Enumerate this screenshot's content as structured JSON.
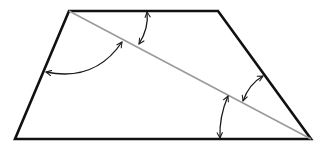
{
  "diagram": {
    "type": "geometry",
    "shape": "trapezoid",
    "colors": {
      "edge": "#111111",
      "diagonal": "#9a9a9a",
      "arrow": "#1a1a1a",
      "background": "#ffffff"
    },
    "vertices": {
      "top_left": [
        69,
        11
      ],
      "top_right": [
        218,
        11
      ],
      "bottom_right": [
        311,
        139
      ],
      "bottom_left": [
        15,
        139
      ]
    },
    "diagonal": {
      "from": "top_left",
      "to": "bottom_right"
    },
    "angle_arrows": [
      {
        "id": "top-angle",
        "between": [
          "top_edge",
          "diagonal"
        ],
        "start": [
          147,
          12
        ],
        "end": [
          139,
          44
        ],
        "curve": [
          149,
          28
        ]
      },
      {
        "id": "left-angle",
        "between": [
          "left_edge",
          "diagonal"
        ],
        "start": [
          46,
          72
        ],
        "end": [
          122,
          42
        ],
        "curve": [
          95,
          82
        ]
      },
      {
        "id": "right-angle",
        "between": [
          "right_edge",
          "diagonal"
        ],
        "start": [
          263,
          76
        ],
        "end": [
          243,
          101
        ],
        "curve": [
          249,
          84
        ]
      },
      {
        "id": "bottom-angle",
        "between": [
          "diagonal",
          "bottom_edge"
        ],
        "start": [
          228,
          96
        ],
        "end": [
          220,
          138
        ],
        "curve": [
          219,
          117
        ]
      }
    ]
  }
}
